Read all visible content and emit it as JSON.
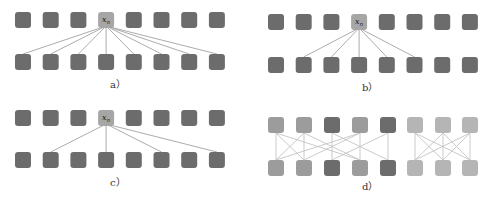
{
  "colors": {
    "node_dark": "#6c6c6c",
    "node_highlight": "#a6a6a6",
    "node_mid": "#9c9c9c",
    "node_light": "#b5b5b5",
    "edge": "#a3a3a3",
    "edge_light": "#c4c4c4"
  },
  "panels": [
    {
      "id": "a",
      "label": "a）",
      "center_label": "x",
      "center_sub": "n",
      "description": "full connection: x_n to all 8 outputs",
      "connections": [
        0,
        1,
        2,
        3,
        4,
        5,
        6,
        7
      ]
    },
    {
      "id": "b",
      "label": "b）",
      "center_label": "x",
      "center_sub": "n",
      "description": "local connection: x_n to neighbors 1..5",
      "connections": [
        1,
        2,
        3,
        4,
        5
      ]
    },
    {
      "id": "c",
      "label": "c）",
      "center_label": "x",
      "center_sub": "n",
      "description": "dilated connection: x_n to 1,3,5,7",
      "connections": [
        1,
        3,
        5,
        7
      ]
    },
    {
      "id": "d",
      "label": "d）",
      "description": "grouped connections: interleaved groups + block group",
      "left_group_colors": [
        "mid",
        "mid",
        "dark",
        "mid",
        "dark"
      ],
      "left_edges": [
        [
          0,
          0
        ],
        [
          0,
          1
        ],
        [
          0,
          3
        ],
        [
          1,
          0
        ],
        [
          1,
          1
        ],
        [
          1,
          3
        ],
        [
          3,
          0
        ],
        [
          3,
          1
        ],
        [
          3,
          3
        ],
        [
          2,
          2
        ],
        [
          2,
          4
        ],
        [
          4,
          2
        ],
        [
          4,
          4
        ]
      ],
      "right_group_size": 3
    }
  ]
}
